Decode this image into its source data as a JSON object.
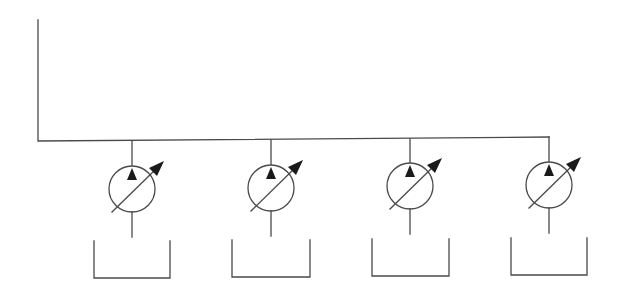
{
  "diagram": {
    "type": "hydraulic-schematic",
    "colors": {
      "line": "#4a4a4a",
      "fill": "#1a1a1a",
      "background": "#ffffff"
    },
    "main_line": {
      "points": [
        [
          38,
          20
        ],
        [
          38,
          141
        ],
        [
          549,
          137
        ]
      ]
    },
    "pumps": [
      {
        "id": "pump-1",
        "label": "Variable displacement pump 1",
        "cx": 132,
        "cy": 189,
        "r": 23,
        "line_top_y": 141,
        "tank": {
          "left": 94,
          "right": 170,
          "top": 241,
          "bottom": 278
        }
      },
      {
        "id": "pump-2",
        "label": "Variable displacement pump 2",
        "cx": 271,
        "cy": 188,
        "r": 23,
        "line_top_y": 140,
        "tank": {
          "left": 232,
          "right": 310,
          "top": 240,
          "bottom": 277
        }
      },
      {
        "id": "pump-3",
        "label": "Variable displacement pump 3",
        "cx": 410,
        "cy": 186,
        "r": 23,
        "line_top_y": 139,
        "tank": {
          "left": 372,
          "right": 449,
          "top": 239,
          "bottom": 276
        }
      },
      {
        "id": "pump-4",
        "label": "Variable displacement pump 4",
        "cx": 549,
        "cy": 185,
        "r": 23,
        "line_top_y": 137,
        "tank": {
          "left": 511,
          "right": 587,
          "top": 238,
          "bottom": 275
        }
      }
    ]
  }
}
